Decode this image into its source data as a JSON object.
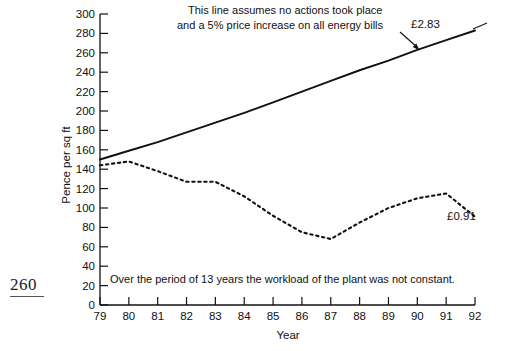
{
  "page": {
    "folio": "260"
  },
  "chart_data": {
    "type": "line",
    "title": "",
    "xlabel": "Year",
    "ylabel": "Pence per sq ft",
    "xlim": [
      79,
      92
    ],
    "ylim": [
      0,
      300
    ],
    "ytick_step": 20,
    "grid": false,
    "legend_position": "none",
    "categories": [
      "79",
      "80",
      "81",
      "82",
      "83",
      "84",
      "85",
      "86",
      "87",
      "88",
      "89",
      "90",
      "91",
      "92"
    ],
    "x": [
      79,
      80,
      81,
      82,
      83,
      84,
      85,
      86,
      87,
      88,
      89,
      90,
      91,
      92
    ],
    "yticks": [
      0,
      20,
      40,
      60,
      80,
      100,
      120,
      140,
      160,
      180,
      200,
      220,
      240,
      260,
      280,
      300
    ],
    "series": [
      {
        "name": "Projected cost with no action (5% annual price increase)",
        "style": "solid",
        "end_label": "£2.83",
        "values": [
          150,
          159,
          168,
          178,
          188,
          198,
          209,
          220,
          231,
          242,
          252,
          263,
          273,
          283
        ]
      },
      {
        "name": "Actual cost",
        "style": "dotted",
        "end_label": "£0.91",
        "values": [
          144,
          148,
          138,
          127,
          127,
          112,
          92,
          75,
          68,
          85,
          100,
          110,
          115,
          91
        ]
      }
    ],
    "annotations": [
      {
        "name": "projection-note",
        "line1": "This line assumes no actions took place",
        "line2": "and a 5% price increase on all energy bills",
        "has_arrow": true
      },
      {
        "name": "workload-note",
        "text": "Over the period of 13 years the workload of the plant was not constant."
      }
    ],
    "axis_tick_labels_x": [
      "79",
      "80",
      "81",
      "82",
      "83",
      "84",
      "85",
      "86",
      "87",
      "88",
      "89",
      "90",
      "91",
      "92"
    ],
    "axis_tick_labels_y": [
      "0",
      "20",
      "40",
      "60",
      "80",
      "100",
      "120",
      "140",
      "160",
      "180",
      "200",
      "220",
      "240",
      "260",
      "280",
      "300"
    ],
    "colors": {
      "line": "#111111",
      "axis": "#111111",
      "background": "#ffffff"
    }
  }
}
